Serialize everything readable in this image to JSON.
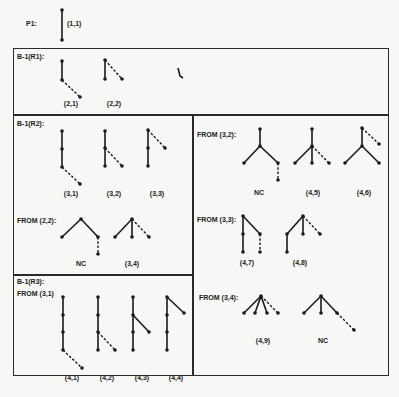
{
  "top": {
    "label": "P1:",
    "caption": "(1,1)"
  },
  "section_r1": {
    "title": "B-1(R1):",
    "captions": [
      "(2,1)",
      "(2,2)"
    ]
  },
  "section_r2": {
    "title": "B-1(R2):",
    "captions": [
      "(3,1)",
      "(3,2)",
      "(3,3)"
    ],
    "from_22": {
      "label": "FROM (2,2):",
      "captions": [
        "NC",
        "(3,4)"
      ]
    }
  },
  "section_right": {
    "from_32": {
      "label": "FROM (3,2):",
      "captions": [
        "NC",
        "(4,5)",
        "(4,6)"
      ]
    },
    "from_33": {
      "label": "FROM (3,3):",
      "captions": [
        "(4,7)",
        "(4,8)"
      ]
    },
    "from_34": {
      "label": "FROM (3,4):",
      "captions": [
        "(4,9)",
        "NC"
      ]
    }
  },
  "section_r3": {
    "title": "B-1(R3):",
    "from_31": {
      "label": "FROM (3,1)",
      "captions": [
        "(4,1)",
        "(4,2)",
        "(4,3)",
        "(4,4)"
      ]
    }
  }
}
